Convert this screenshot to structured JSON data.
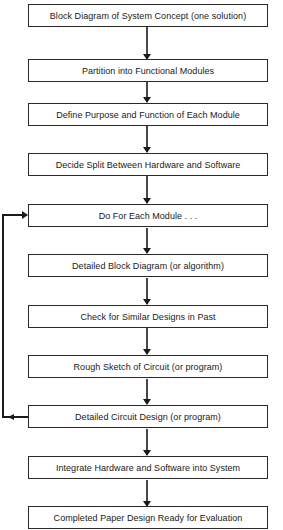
{
  "diagram": {
    "type": "flowchart",
    "steps": [
      {
        "label": "Block Diagram of System Concept (one solution)"
      },
      {
        "label": "Partition into Functional Modules"
      },
      {
        "label": "Define Purpose and Function of Each Module"
      },
      {
        "label": "Decide Split Between Hardware and Software"
      },
      {
        "label": "Do For Each Module . . ."
      },
      {
        "label": "Detailed Block Diagram (or algorithm)"
      },
      {
        "label": "Check for Similar Designs in Past"
      },
      {
        "label": "Rough Sketch of Circuit (or program)"
      },
      {
        "label": "Detailed Circuit Design (or program)"
      },
      {
        "label": "Integrate Hardware and Software into System"
      },
      {
        "label": "Completed Paper Design Ready for Evaluation"
      }
    ],
    "loop": {
      "from": "Detailed Circuit Design (or program)",
      "to": "Do For Each Module . . ."
    },
    "colors": {
      "line": "#1a1a1a",
      "background": "#ffffff"
    }
  }
}
